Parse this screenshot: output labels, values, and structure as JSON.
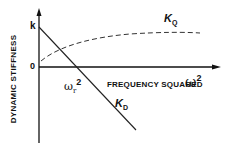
{
  "diagram": {
    "y_axis_label": "DYNAMIC STIFFNESS",
    "x_axis_label": "FREQUENCY SQUARED",
    "x_axis_symbol": "ω",
    "x_axis_exponent": "2",
    "y_tick_k": "k",
    "y_tick_zero": "0",
    "curve_quadrature": {
      "symbol": "K",
      "subscript": "Q",
      "style": "dashed"
    },
    "curve_direct": {
      "symbol": "K",
      "subscript": "D",
      "style": "solid"
    },
    "resonance_label": {
      "symbol": "ω",
      "subscript": "r",
      "exponent": "2"
    }
  }
}
